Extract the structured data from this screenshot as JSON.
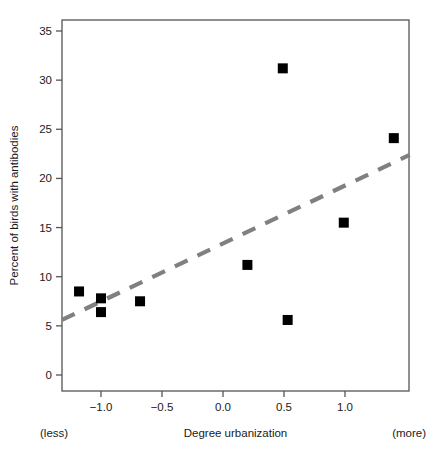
{
  "chart_data": {
    "type": "scatter",
    "title": "",
    "subtitle": "",
    "xlabel": "Degree urbanization",
    "ylabel": "Percent of birds with antibodies",
    "xlim": [
      -1.32,
      1.53
    ],
    "ylim": [
      -0.8,
      36.5
    ],
    "xticks": [
      -1.0,
      -0.5,
      0.0,
      0.5,
      1.0
    ],
    "xtick_labels": [
      "-1.0",
      "-0.5",
      "0.0",
      "0.5",
      "1.0"
    ],
    "yticks": [
      0,
      5,
      10,
      15,
      20,
      25,
      30,
      35
    ],
    "ytick_labels": [
      "0",
      "5",
      "10",
      "15",
      "20",
      "25",
      "30",
      "35"
    ],
    "grid": false,
    "legend": null,
    "marker": "filled-square",
    "marker_color": "#000000",
    "points": [
      {
        "x": -1.18,
        "y": 8.5
      },
      {
        "x": -1.0,
        "y": 7.8
      },
      {
        "x": -1.0,
        "y": 6.4
      },
      {
        "x": -0.68,
        "y": 7.5
      },
      {
        "x": 0.2,
        "y": 11.2
      },
      {
        "x": 0.49,
        "y": 31.2
      },
      {
        "x": 0.53,
        "y": 5.6
      },
      {
        "x": 0.99,
        "y": 15.5
      },
      {
        "x": 1.4,
        "y": 24.1
      }
    ],
    "trend_line": {
      "style": "dashed",
      "color": "#808080",
      "x_start": -1.32,
      "y_start": 5.6,
      "x_end": 1.53,
      "y_end": 22.4
    },
    "annotations": [
      {
        "text": "(less)",
        "position": "bottom-left"
      },
      {
        "text": "(more)",
        "position": "bottom-right"
      }
    ],
    "axis_color": "#555555"
  }
}
